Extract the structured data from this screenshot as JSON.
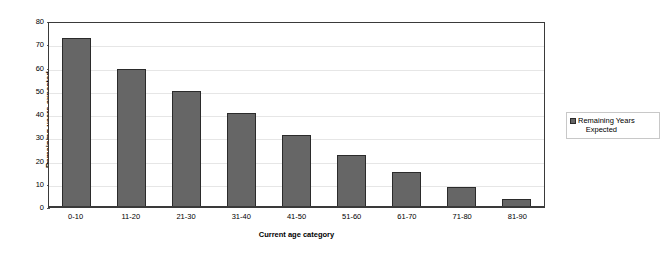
{
  "chart_data": {
    "type": "bar",
    "title": "",
    "xlabel": "Current age category",
    "ylabel": "Remaining years expected",
    "categories": [
      "0-10",
      "11-20",
      "21-30",
      "31-40",
      "41-50",
      "51-60",
      "61-70",
      "71-80",
      "81-90"
    ],
    "values": [
      72.5,
      59.3,
      49.7,
      40.3,
      31.1,
      22.3,
      15.0,
      8.8,
      3.4
    ],
    "series": [
      {
        "name": "Remaining Years Expected",
        "values": [
          72.5,
          59.3,
          49.7,
          40.3,
          31.1,
          22.3,
          15.0,
          8.8,
          3.4
        ],
        "color": "#666666"
      }
    ],
    "ylim": [
      0,
      80
    ],
    "ytick_step": 10,
    "yticks": [
      0,
      10,
      20,
      30,
      40,
      50,
      60,
      70,
      80
    ],
    "ytick_labels": [
      "0",
      "10",
      "20",
      "30",
      "40",
      "50",
      "60",
      "70",
      "80"
    ],
    "grid": true,
    "grid_axis": "y",
    "grid_color": "#e6e6e6",
    "legend_position": "right",
    "plot_border_color": "#3a3a3a",
    "bar_edge_color": "#2b2b2b",
    "background_color": "#ffffff"
  },
  "legend": {
    "entries": [
      {
        "label_line1": "Remaining Years",
        "label_line2": "Expected",
        "full_label": "Remaining Years Expected",
        "swatch_color": "#666666"
      }
    ]
  }
}
